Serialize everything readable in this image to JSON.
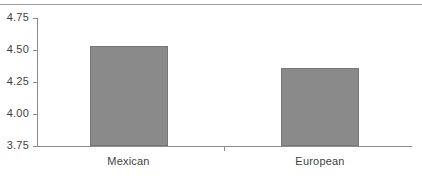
{
  "chart_data": {
    "type": "bar",
    "title": "",
    "subtitle": "",
    "xlabel": "",
    "ylabel": "",
    "categories": [
      "Mexican",
      "European"
    ],
    "values": [
      4.53,
      4.36
    ],
    "ylim": [
      3.75,
      4.75
    ],
    "yticks": [
      "4.75",
      "4.50",
      "4.25",
      "4.00",
      "3.75"
    ],
    "ytick_values": [
      4.75,
      4.5,
      4.25,
      4.0,
      3.75
    ],
    "grid": false,
    "legend": null,
    "bar_color": "#8a8a8a",
    "bar_edge_color": "#787878",
    "axis_color": "#8c8c8c",
    "text_color": "#3f3f3f",
    "rule_color": "#9a9a9a"
  },
  "figure": {
    "top_rule_name": "top-horizontal-rule"
  }
}
